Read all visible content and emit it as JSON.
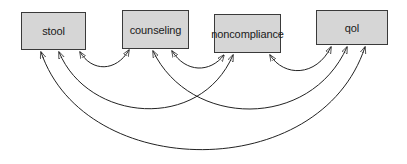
{
  "diagram": {
    "type": "path-diagram",
    "colors": {
      "node_fill": "#d6d6d6",
      "node_border": "#3a3a3a",
      "edge": "#222222",
      "background": "#ffffff"
    },
    "nodes": [
      {
        "id": "stool",
        "label": "stool",
        "x": 21,
        "y": 12,
        "w": 65,
        "h": 38
      },
      {
        "id": "counseling",
        "label": "counseling",
        "x": 122,
        "y": 10,
        "w": 67,
        "h": 39
      },
      {
        "id": "noncompliance",
        "label": "noncompliance",
        "x": 214,
        "y": 14,
        "w": 67,
        "h": 39
      },
      {
        "id": "qol",
        "label": "qol",
        "x": 316,
        "y": 10,
        "w": 72,
        "h": 35
      }
    ],
    "edges": [
      {
        "from": "stool",
        "to": "counseling",
        "type": "double-headed"
      },
      {
        "from": "counseling",
        "to": "noncompliance",
        "type": "double-headed"
      },
      {
        "from": "noncompliance",
        "to": "qol",
        "type": "double-headed"
      },
      {
        "from": "stool",
        "to": "noncompliance",
        "type": "double-headed"
      },
      {
        "from": "counseling",
        "to": "qol",
        "type": "double-headed"
      },
      {
        "from": "stool",
        "to": "qol",
        "type": "double-headed"
      }
    ]
  }
}
